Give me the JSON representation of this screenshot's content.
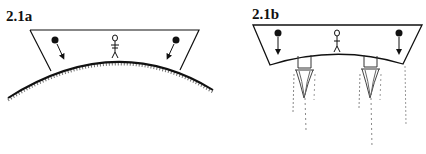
{
  "figures": [
    {
      "id": "a",
      "label": "2.1a",
      "description": "Trapezoidal room resting on curved planet surface; balls fall toward planet center; person standing"
    },
    {
      "id": "b",
      "label": "2.1b",
      "description": "Trapezoidal rocket-propelled room with curved floor; two engines firing exhaust; balls fall straight down; person standing"
    }
  ],
  "colors": {
    "ink": "#111111",
    "background": "#ffffff",
    "exhaust": "#555555"
  }
}
